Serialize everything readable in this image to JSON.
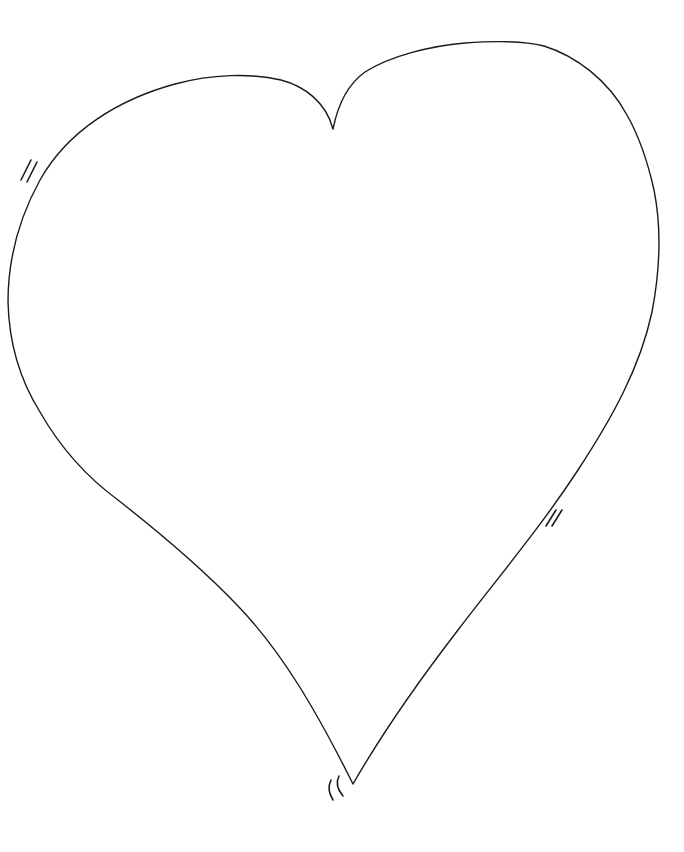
{
  "figure": {
    "width": 684,
    "height": 852,
    "background_color": "#ffffff",
    "stroke_color": "#1a1a1a",
    "outline_stroke_width": 1.4,
    "tick_stroke_width": 1.6,
    "heart_outline_path": "M 333 129 C 326 102 304 86 281 80 C 250 73 212 74 175 84 C 120 99 68 130 40 180 C 18 220 8 262 8 302 C 9 343 20 380 40 412 C 60 447 88 478 118 500 C 160 533 200 566 238 606 C 282 652 316 710 353 784 C 384 730 418 682 458 630 C 500 575 540 528 578 470 C 612 418 640 368 652 312 C 660 270 662 230 654 190 C 648 163 640 138 627 115 C 608 80 576 56 544 46 C 520 40 492 41 465 43 C 430 46 390 56 365 72 C 348 84 338 104 333 129",
    "tick_marks": [
      {
        "name": "left-tick-marks",
        "paths": [
          "M 31 160 L 21 180",
          "M 37 162 L 27 182"
        ]
      },
      {
        "name": "right-tick-marks",
        "paths": [
          "M 556 510 L 546 526",
          "M 562 510 L 552 526"
        ]
      },
      {
        "name": "bottom-tick-marks",
        "paths": [
          "M 331 780 C 328 786 328 792 333 800",
          "M 339 776 C 336 782 337 789 343 796"
        ]
      }
    ]
  }
}
